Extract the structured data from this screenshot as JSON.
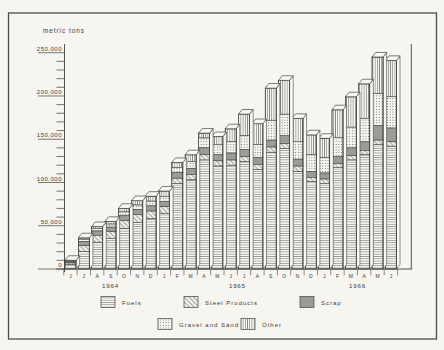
{
  "colors": {
    "ink": "#3b3b3b",
    "paper": "#f6f5f0",
    "face": "#faf9f5",
    "outline": "#424242"
  },
  "chart_data": {
    "type": "bar",
    "stacked": true,
    "title": "",
    "ylabel": "metric tons",
    "xlabel": "",
    "unit": "metric tons",
    "ylim": [
      0,
      250000
    ],
    "ytick_interval": 50000,
    "yminor_interval": 10000,
    "ytick_labels": [
      "0",
      "50,000",
      "100,000",
      "150,000",
      "200,000",
      "250,000"
    ],
    "grid": false,
    "legend_position": "bottom",
    "categories": [
      "J",
      "J",
      "A",
      "S",
      "O",
      "N",
      "D",
      "J",
      "F",
      "M",
      "A",
      "M",
      "J",
      "J",
      "A",
      "S",
      "O",
      "N",
      "D",
      "J",
      "F",
      "M",
      "A",
      "M",
      "J"
    ],
    "year_groups": [
      {
        "label": "1964",
        "start": 0,
        "end": 6
      },
      {
        "label": "1965",
        "start": 7,
        "end": 18
      },
      {
        "label": "1966",
        "start": 19,
        "end": 24
      }
    ],
    "series": [
      {
        "name": "Fuels",
        "pattern": "horizontal-lines",
        "values": [
          5500,
          20000,
          31000,
          35000,
          47000,
          54000,
          58000,
          64000,
          99000,
          103000,
          126000,
          119000,
          120000,
          124000,
          115000,
          135000,
          139000,
          113000,
          101000,
          99000,
          117000,
          126000,
          132000,
          144000,
          142000
        ]
      },
      {
        "name": "Steel Products",
        "pattern": "diagonal-lines",
        "values": [
          1500,
          7000,
          8000,
          8000,
          9000,
          9000,
          9000,
          8000,
          6000,
          6500,
          6000,
          6000,
          6000,
          6000,
          6000,
          6000,
          6000,
          6000,
          5000,
          5000,
          5000,
          5000,
          5000,
          5000,
          5000
        ]
      },
      {
        "name": "Scrap",
        "pattern": "crosshatch-grid",
        "values": [
          1200,
          5000,
          5000,
          5500,
          5500,
          6000,
          6000,
          6000,
          6500,
          7000,
          8000,
          7500,
          8000,
          8000,
          8000,
          8000,
          9000,
          8000,
          7000,
          7000,
          8000,
          9000,
          10000,
          17000,
          16000
        ]
      },
      {
        "name": "Gravel and Sand",
        "pattern": "dots",
        "values": [
          1000,
          2500,
          3000,
          3500,
          4500,
          5000,
          5500,
          6000,
          6000,
          8000,
          11500,
          11000,
          13000,
          16000,
          15000,
          23000,
          25000,
          20000,
          19000,
          18000,
          22000,
          24000,
          27000,
          37000,
          36000
        ]
      },
      {
        "name": "Other",
        "pattern": "vertical-lines",
        "values": [
          800,
          1500,
          2000,
          3000,
          4000,
          5000,
          5500,
          6000,
          5500,
          7500,
          5500,
          9500,
          15000,
          25000,
          24000,
          37000,
          39000,
          27000,
          23000,
          22000,
          32000,
          35000,
          40000,
          42000,
          42000
        ]
      }
    ],
    "totals": [
      10000,
      36000,
      49000,
      55000,
      70000,
      79000,
      84000,
      90000,
      123000,
      132000,
      157000,
      153000,
      162000,
      179000,
      168000,
      209000,
      218000,
      174000,
      155000,
      151000,
      184000,
      199000,
      214000,
      245000,
      241000
    ],
    "legend": {
      "rows": [
        [
          "Fuels",
          "Steel Products",
          "Scrap"
        ],
        [
          "Gravel and Sand",
          "Other"
        ]
      ]
    }
  }
}
